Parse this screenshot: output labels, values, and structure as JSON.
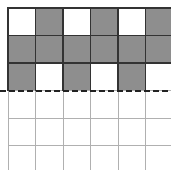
{
  "diagram": {
    "type": "grid-pattern",
    "columns": 6,
    "rows": 6,
    "cell_size": 27.5,
    "origin": [
      8,
      8
    ],
    "colors": {
      "shaded": "#8e8e8e",
      "empty": "#ffffff",
      "shaded_border": "#333333",
      "grid_line": "#b0b0b0",
      "dashed_line": "#222222"
    },
    "shaded_cells": [
      [
        0,
        1
      ],
      [
        0,
        3
      ],
      [
        0,
        5
      ],
      [
        1,
        0
      ],
      [
        1,
        1
      ],
      [
        1,
        2
      ],
      [
        1,
        3
      ],
      [
        1,
        4
      ],
      [
        1,
        5
      ],
      [
        2,
        0
      ],
      [
        2,
        2
      ],
      [
        2,
        4
      ]
    ],
    "dashed_line_after_row": 3
  }
}
